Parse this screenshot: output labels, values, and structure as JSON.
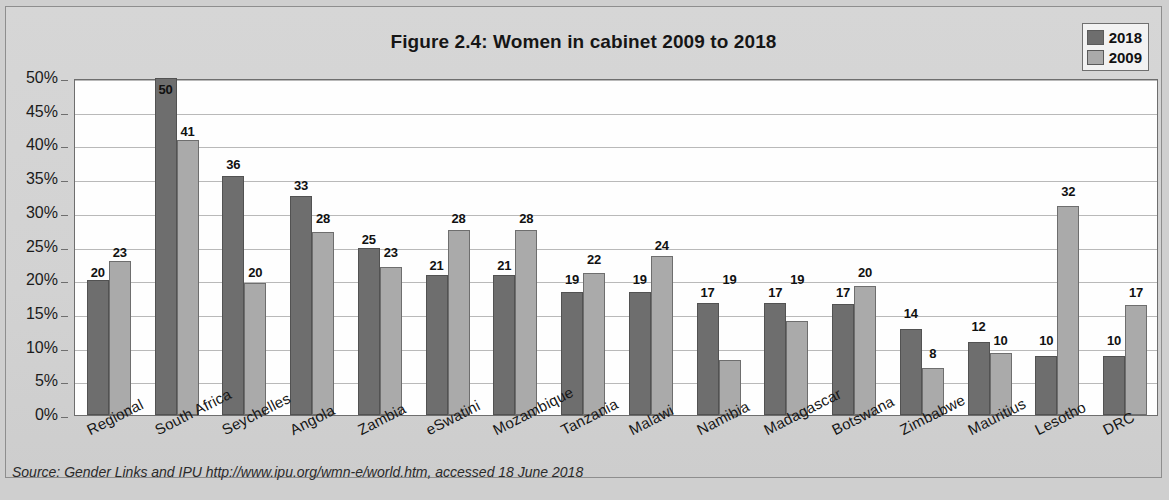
{
  "figure": {
    "title": "Figure 2.4: Women in cabinet 2009 to 2018",
    "source": "Source: Gender Links and IPU http://www.ipu.org/wmn-e/world.htm, accessed 18 June 2018"
  },
  "legend": {
    "items": [
      {
        "label": "2018",
        "color": "#6e6e6e"
      },
      {
        "label": "2009",
        "color": "#aaaaaa"
      }
    ]
  },
  "chart_data": {
    "type": "bar",
    "title": "Figure 2.4: Women in cabinet 2009 to 2018",
    "xlabel": "",
    "ylabel": "",
    "ylim": [
      0,
      50
    ],
    "ytick_labels": [
      "0%",
      "5%",
      "10%",
      "15%",
      "20%",
      "25%",
      "30%",
      "35%",
      "40%",
      "45%",
      "50%"
    ],
    "ytick_values": [
      0,
      5,
      10,
      15,
      20,
      25,
      30,
      35,
      40,
      45,
      50
    ],
    "grid": true,
    "legend_position": "top-right",
    "categories": [
      "Regional",
      "South Africa",
      "Seychelles",
      "Angola",
      "Zambia",
      "eSwatini",
      "Mozambique",
      "Tanzania",
      "Malawi",
      "Namibia",
      "Madagascar",
      "Botswana",
      "Zimbabwe",
      "Mauritius",
      "Lesotho",
      "DRC"
    ],
    "series": [
      {
        "name": "2018",
        "color": "#6e6e6e",
        "values": [
          20,
          50,
          36,
          33,
          25,
          21,
          21,
          19,
          19,
          17,
          17,
          17,
          14,
          12,
          10,
          10
        ],
        "drawn": [
          20.0,
          50.0,
          35.5,
          32.5,
          24.8,
          20.8,
          20.8,
          18.3,
          18.2,
          16.6,
          16.6,
          16.5,
          12.8,
          10.8,
          8.8,
          8.8
        ]
      },
      {
        "name": "2009",
        "color": "#aaaaaa",
        "values": [
          23,
          41,
          20,
          28,
          23,
          28,
          28,
          22,
          24,
          19,
          19,
          20,
          8,
          10,
          32,
          17
        ],
        "drawn": [
          22.8,
          40.8,
          19.6,
          27.1,
          22.0,
          27.5,
          27.4,
          21.0,
          23.6,
          8.2,
          14.0,
          19.2,
          7.0,
          9.2,
          31.0,
          16.3
        ]
      }
    ]
  }
}
